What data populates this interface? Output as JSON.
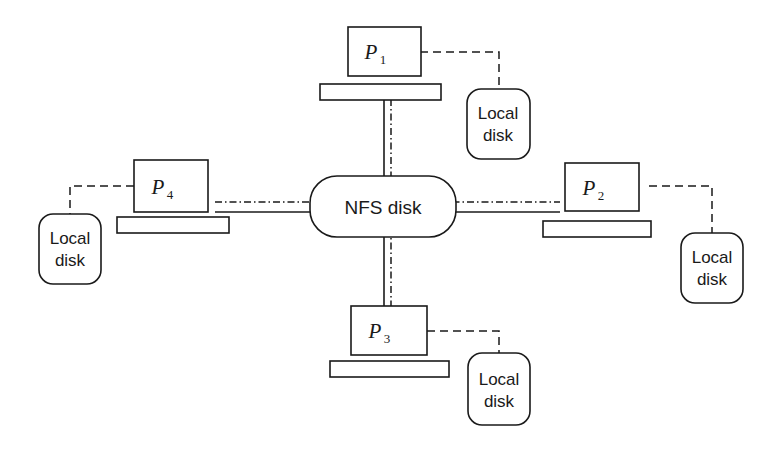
{
  "diagram": {
    "central_node": {
      "id": "nfs-disk",
      "label": "NFS disk",
      "shape": "rounded-rectangle"
    },
    "processors": [
      {
        "id": "p1",
        "label": "P",
        "subscript": "1",
        "position": "top",
        "bus_label": "",
        "local_disk": {
          "line1": "Local",
          "line2": "disk",
          "position": "right-of-processor"
        }
      },
      {
        "id": "p2",
        "label": "P",
        "subscript": "2",
        "position": "right",
        "bus_label": "",
        "local_disk": {
          "line1": "Local",
          "line2": "disk",
          "position": "below-right-of-processor"
        }
      },
      {
        "id": "p3",
        "label": "P",
        "subscript": "3",
        "position": "bottom",
        "bus_label": "",
        "local_disk": {
          "line1": "Local",
          "line2": "disk",
          "position": "right-of-processor"
        }
      },
      {
        "id": "p4",
        "label": "P",
        "subscript": "4",
        "position": "left",
        "bus_label": "",
        "local_disk": {
          "line1": "Local",
          "line2": "disk",
          "position": "below-left-of-processor"
        }
      }
    ],
    "connections": [
      {
        "id": "p1-nfs",
        "from": "p1-bus",
        "to": "nfs-disk",
        "styles": [
          "solid",
          "dash-dot"
        ]
      },
      {
        "id": "p2-nfs",
        "from": "p2-bus",
        "to": "nfs-disk",
        "styles": [
          "solid",
          "dash-dot"
        ]
      },
      {
        "id": "p3-nfs",
        "from": "p3-bus",
        "to": "nfs-disk",
        "styles": [
          "solid",
          "dash-dot"
        ]
      },
      {
        "id": "p4-nfs",
        "from": "p4-bus",
        "to": "nfs-disk",
        "styles": [
          "solid",
          "dash-dot"
        ]
      },
      {
        "id": "p1-localdisk",
        "from": "p1",
        "to": "p1-local-disk",
        "styles": [
          "dashed"
        ]
      },
      {
        "id": "p2-localdisk",
        "from": "p2",
        "to": "p2-local-disk",
        "styles": [
          "dashed"
        ]
      },
      {
        "id": "p3-localdisk",
        "from": "p3",
        "to": "p3-local-disk",
        "styles": [
          "dashed"
        ]
      },
      {
        "id": "p4-localdisk",
        "from": "p4",
        "to": "p4-local-disk",
        "styles": [
          "dashed"
        ]
      }
    ],
    "colors": {
      "stroke": "#1a1a1a",
      "fill": "#ffffff",
      "background": "#ffffff"
    }
  }
}
